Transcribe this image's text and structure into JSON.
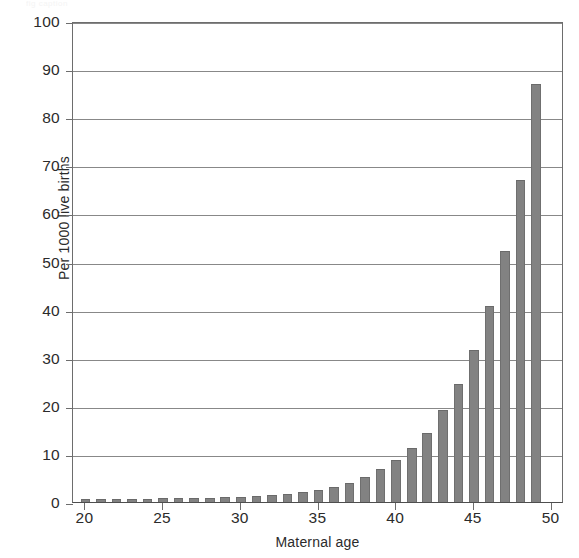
{
  "figure": {
    "top_artifact_text": "fig caption",
    "background_color": "#ffffff",
    "bar_color": "#828282",
    "grid_color": "#888888",
    "axis_color": "#6d6d6d",
    "text_color": "#2b2b2b"
  },
  "chart_data": {
    "type": "bar",
    "title": "",
    "xlabel": "Maternal age",
    "ylabel": "Per 1000 live births",
    "xlim": [
      19.2,
      50.8
    ],
    "ylim": [
      0,
      100
    ],
    "grid": true,
    "legend": "none",
    "ytick_labels": [
      "0",
      "10",
      "20",
      "30",
      "40",
      "50",
      "60",
      "70",
      "80",
      "90",
      "100"
    ],
    "ytick_values": [
      0,
      10,
      20,
      30,
      40,
      50,
      60,
      70,
      80,
      90,
      100
    ],
    "xtick_labels": [
      "20",
      "25",
      "30",
      "35",
      "40",
      "45",
      "50"
    ],
    "xtick_values": [
      20,
      25,
      30,
      35,
      40,
      45,
      50
    ],
    "categories": [
      20,
      21,
      22,
      23,
      24,
      25,
      26,
      27,
      28,
      29,
      30,
      31,
      32,
      33,
      34,
      35,
      36,
      37,
      38,
      39,
      40,
      41,
      42,
      43,
      44,
      45,
      46,
      47,
      48,
      49,
      50
    ],
    "values": [
      0.7,
      0.7,
      0.7,
      0.6,
      0.7,
      0.8,
      0.8,
      0.9,
      0.9,
      1.0,
      1.1,
      1.2,
      1.4,
      1.6,
      2.0,
      2.4,
      3.1,
      4.0,
      5.2,
      6.8,
      8.8,
      11.3,
      14.4,
      19.2,
      24.6,
      31.6,
      40.7,
      52.2,
      67.0,
      87.0,
      0
    ]
  }
}
